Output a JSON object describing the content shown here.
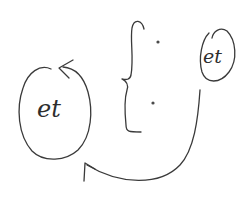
{
  "diagram": {
    "type": "hand-drawn sketch",
    "left_node": {
      "label": "et"
    },
    "right_node": {
      "label": "et"
    },
    "brace": {
      "items": [
        "•",
        "•"
      ]
    },
    "connections": [
      {
        "from": "right_node",
        "to": "left_node",
        "style": "curved arrow"
      },
      {
        "from": "left_node",
        "to": "left_node",
        "style": "circular arrow"
      }
    ],
    "colors": {
      "ink": "#3a3a3a",
      "background": "#ffffff"
    }
  }
}
